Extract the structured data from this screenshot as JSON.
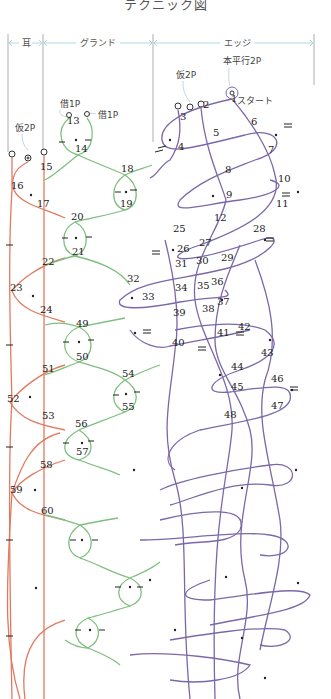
{
  "title": "テクニック図",
  "sections": [
    {
      "label": "耳",
      "x1": 8,
      "x2": 43
    },
    {
      "label": "グランド",
      "x1": 43,
      "x2": 153
    },
    {
      "label": "エッジ",
      "x1": 153,
      "x2": 314
    }
  ],
  "annotations": {
    "honheiko": "本平行2P",
    "kari_edge": "仮2P",
    "start": "スタート",
    "kari_ear": "仮2P",
    "kari1": "借1P",
    "kari2": "借1P"
  },
  "colors": {
    "ear": "#e07a5f",
    "ground": "#7fbf7f",
    "edge": "#7b68a8",
    "guide": "#9fcbe0",
    "divider": "#888888",
    "ink": "#222222"
  },
  "pin_numbers": [
    {
      "n": "1",
      "x": 231,
      "y": 102
    },
    {
      "n": "2",
      "x": 203,
      "y": 108
    },
    {
      "n": "3",
      "x": 180,
      "y": 120
    },
    {
      "n": "4",
      "x": 178,
      "y": 150
    },
    {
      "n": "5",
      "x": 213,
      "y": 136
    },
    {
      "n": "6",
      "x": 251,
      "y": 125
    },
    {
      "n": "7",
      "x": 268,
      "y": 153
    },
    {
      "n": "8",
      "x": 225,
      "y": 173
    },
    {
      "n": "9",
      "x": 226,
      "y": 198
    },
    {
      "n": "10",
      "x": 278,
      "y": 182
    },
    {
      "n": "11",
      "x": 276,
      "y": 207
    },
    {
      "n": "12",
      "x": 214,
      "y": 221
    },
    {
      "n": "13",
      "x": 67,
      "y": 124
    },
    {
      "n": "14",
      "x": 75,
      "y": 152
    },
    {
      "n": "15",
      "x": 40,
      "y": 170
    },
    {
      "n": "16",
      "x": 11,
      "y": 189
    },
    {
      "n": "17",
      "x": 37,
      "y": 207
    },
    {
      "n": "18",
      "x": 121,
      "y": 172
    },
    {
      "n": "19",
      "x": 120,
      "y": 207
    },
    {
      "n": "20",
      "x": 71,
      "y": 220
    },
    {
      "n": "21",
      "x": 72,
      "y": 255
    },
    {
      "n": "22",
      "x": 42,
      "y": 265
    },
    {
      "n": "23",
      "x": 10,
      "y": 291
    },
    {
      "n": "24",
      "x": 40,
      "y": 313
    },
    {
      "n": "25",
      "x": 173,
      "y": 232
    },
    {
      "n": "26",
      "x": 177,
      "y": 252
    },
    {
      "n": "27",
      "x": 199,
      "y": 246
    },
    {
      "n": "28",
      "x": 253,
      "y": 232
    },
    {
      "n": "29",
      "x": 221,
      "y": 261
    },
    {
      "n": "30",
      "x": 196,
      "y": 264
    },
    {
      "n": "31",
      "x": 175,
      "y": 267
    },
    {
      "n": "32",
      "x": 127,
      "y": 282
    },
    {
      "n": "33",
      "x": 142,
      "y": 300
    },
    {
      "n": "34",
      "x": 175,
      "y": 291
    },
    {
      "n": "35",
      "x": 197,
      "y": 289
    },
    {
      "n": "36",
      "x": 211,
      "y": 285
    },
    {
      "n": "37",
      "x": 217,
      "y": 305
    },
    {
      "n": "38",
      "x": 202,
      "y": 312
    },
    {
      "n": "39",
      "x": 173,
      "y": 316
    },
    {
      "n": "40",
      "x": 172,
      "y": 346
    },
    {
      "n": "41",
      "x": 217,
      "y": 336
    },
    {
      "n": "42",
      "x": 238,
      "y": 330
    },
    {
      "n": "43",
      "x": 261,
      "y": 356
    },
    {
      "n": "44",
      "x": 231,
      "y": 370
    },
    {
      "n": "45",
      "x": 231,
      "y": 390
    },
    {
      "n": "46",
      "x": 271,
      "y": 382
    },
    {
      "n": "47",
      "x": 271,
      "y": 409
    },
    {
      "n": "48",
      "x": 224,
      "y": 418
    },
    {
      "n": "49",
      "x": 76,
      "y": 327
    },
    {
      "n": "50",
      "x": 76,
      "y": 360
    },
    {
      "n": "51",
      "x": 42,
      "y": 372
    },
    {
      "n": "52",
      "x": 7,
      "y": 402
    },
    {
      "n": "53",
      "x": 42,
      "y": 419
    },
    {
      "n": "54",
      "x": 122,
      "y": 377
    },
    {
      "n": "55",
      "x": 122,
      "y": 410
    },
    {
      "n": "56",
      "x": 75,
      "y": 427
    },
    {
      "n": "57",
      "x": 76,
      "y": 455
    },
    {
      "n": "58",
      "x": 40,
      "y": 468
    },
    {
      "n": "59",
      "x": 10,
      "y": 493
    },
    {
      "n": "60",
      "x": 41,
      "y": 514
    }
  ]
}
